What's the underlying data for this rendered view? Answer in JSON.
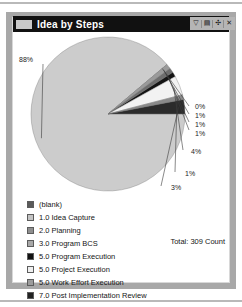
{
  "window": {
    "title": "Idea by Steps",
    "icon": "panel-icon",
    "controls": [
      {
        "name": "filter-button",
        "glyph": "▽"
      },
      {
        "name": "export-button",
        "glyph": "▤"
      },
      {
        "name": "expand-button",
        "glyph": "✣"
      },
      {
        "name": "close-button",
        "glyph": "✕"
      }
    ]
  },
  "chart_data": {
    "type": "pie",
    "title": "Idea by Steps",
    "total_label": "Total: 309 Count",
    "total_value": 309,
    "total_unit": "Count",
    "legend_position": "bottom",
    "categories": [
      "(blank)",
      "1.0 Idea Capture",
      "2.0 Planning",
      "3.0 Program BCS",
      "5.0 Program Execution",
      "5.0 Project Execution",
      "5.0 Work Effort Execution",
      "7.0 Post Implementation Review"
    ],
    "values": [
      88,
      0,
      1,
      1,
      1,
      4,
      1,
      3
    ],
    "data_labels": [
      "88%",
      "0%",
      "1%",
      "1%",
      "1%",
      "4%",
      "1%",
      "3%"
    ],
    "colors": [
      "#cccccc",
      "#4a4a4a",
      "#9a9a9a",
      "#6e6e6e",
      "#141414",
      "#f2f2f2",
      "#8a8a8a",
      "#2b2b2b"
    ],
    "legend_colors": [
      "#5a5a5a",
      "#c4c4c4",
      "#8f8f8f",
      "#a8a8a8",
      "#111111",
      "#efefef",
      "#9c9c9c",
      "#222222"
    ]
  }
}
